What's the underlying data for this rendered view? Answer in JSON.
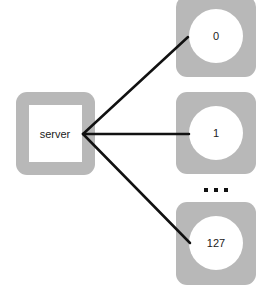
{
  "diagram": {
    "type": "star-topology",
    "colors": {
      "box_fill": "#b8b8b8",
      "inner_fill": "#ffffff",
      "edge": "#111111",
      "text": "#222222"
    },
    "server": {
      "id": "server",
      "label": "server",
      "shape": "square"
    },
    "clients": [
      {
        "id": "client-0",
        "label": "0",
        "shape": "circle"
      },
      {
        "id": "client-1",
        "label": "1",
        "shape": "circle"
      },
      {
        "id": "client-127",
        "label": "127",
        "shape": "circle"
      }
    ],
    "ellipsis": {
      "label": "...",
      "meaning": "clients 2 to 126 omitted"
    },
    "edges": [
      {
        "from": "server",
        "to": "client-0"
      },
      {
        "from": "server",
        "to": "client-1"
      },
      {
        "from": "server",
        "to": "client-127"
      }
    ]
  }
}
